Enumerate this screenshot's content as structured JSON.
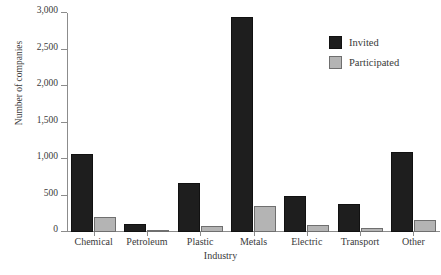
{
  "chart_data": {
    "type": "bar",
    "title": "",
    "xlabel": "Industry",
    "ylabel": "Number of companies",
    "categories": [
      "Chemical",
      "Petroleum",
      "Plastic",
      "Metals",
      "Electric",
      "Transport",
      "Other"
    ],
    "series": [
      {
        "name": "Invited",
        "color": "#1e1e1e",
        "values": [
          1070,
          115,
          670,
          2950,
          500,
          380,
          1090
        ]
      },
      {
        "name": "Participated",
        "color": "#b4b4b4",
        "values": [
          210,
          15,
          80,
          350,
          90,
          50,
          160
        ]
      }
    ],
    "ylim": [
      0,
      3000
    ],
    "y_ticks": [
      0,
      500,
      1000,
      1500,
      2000,
      2500,
      3000
    ],
    "y_tick_labels": [
      "0",
      "500",
      "1,000",
      "1,500",
      "2,000",
      "2,500",
      "3,000"
    ],
    "grid": false,
    "legend_position": "top-right"
  },
  "legend": {
    "entries": [
      {
        "label": "Invited",
        "color": "#1e1e1e"
      },
      {
        "label": "Participated",
        "color": "#b4b4b4"
      }
    ]
  },
  "axes": {
    "y_title": "Number of companies",
    "x_title": "Industry"
  }
}
